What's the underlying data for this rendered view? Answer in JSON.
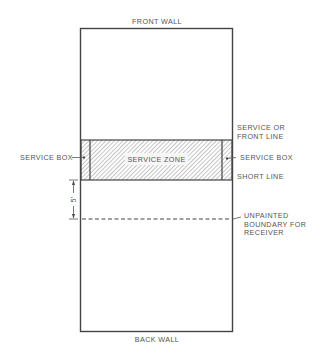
{
  "diagram": {
    "title_top": "FRONT WALL",
    "title_bottom": "BACK WALL",
    "zone_label": "SERVICE ZONE",
    "left_labels": {
      "service_box": "SERVICE BOX"
    },
    "right_labels": {
      "service_line_1": "SERVICE OR",
      "service_line_2": "FRONT LINE",
      "service_box": "SERVICE BOX",
      "short_line": "SHORT LINE",
      "boundary_1": "UNPAINTED",
      "boundary_2": "BOUNDARY FOR",
      "boundary_3": "RECEIVER"
    },
    "dimension_label": "5'",
    "colors": {
      "line": "#444444",
      "text": "#555555",
      "hatch": "#888888",
      "background": "#ffffff"
    }
  }
}
